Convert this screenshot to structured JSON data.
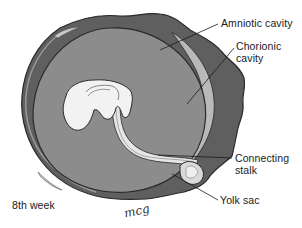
{
  "diagram": {
    "title": "8th week",
    "signature": "mcg",
    "labels": {
      "amniotic_cavity": "Amniotic cavity",
      "chorionic_cavity_line1": "Chorionic",
      "chorionic_cavity_line2": "cavity",
      "connecting_stalk_line1": "Connecting",
      "connecting_stalk_line2": "stalk",
      "yolk_sac": "Yolk sac"
    },
    "colors": {
      "chorion": "#5f5f5f",
      "amnion": "#8c8c8c",
      "chorionic_cavity": "#b9b9b9",
      "embryo": "#f2f2f2",
      "outline": "#2a2a2a"
    }
  }
}
